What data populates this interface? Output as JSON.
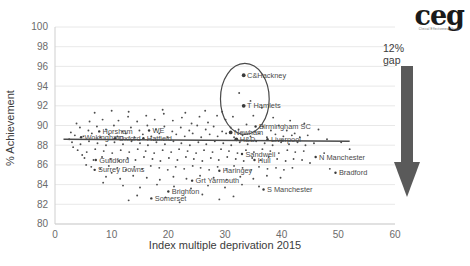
{
  "logo": {
    "word": "ceg",
    "subtitle": "Clinical Effectiveness Group"
  },
  "annotation": {
    "line1": "12%",
    "line2": "gap",
    "arrow": "down-arrow"
  },
  "chart_data": {
    "type": "scatter",
    "title": "",
    "xlabel": "Index multiple deprivation 2015",
    "ylabel": "% Achievement",
    "xlim": [
      0,
      60
    ],
    "ylim": [
      80,
      100
    ],
    "xticks": [
      0,
      10,
      20,
      30,
      40,
      50,
      60
    ],
    "yticks": [
      80,
      82,
      84,
      86,
      88,
      90,
      92,
      94,
      96,
      98,
      100
    ],
    "grid": "horizontal",
    "legend": "none",
    "trendline": {
      "type": "linear",
      "x": [
        1.5,
        52
      ],
      "y": [
        88.6,
        88.4
      ],
      "color": "#4a4a4a"
    },
    "highlight_ellipse": {
      "cx": 33.5,
      "cy": 92.7,
      "rx": 4.3,
      "ry": 3.6,
      "color": "#4a4a4a"
    },
    "labeled_points": [
      {
        "label": "C&Hackney",
        "x": 33.3,
        "y": 95.1
      },
      {
        "label": "T Hamlets",
        "x": 33.3,
        "y": 92.0
      },
      {
        "label": "Birmingham SC",
        "x": 35.4,
        "y": 89.9
      },
      {
        "label": "Newham",
        "x": 31.0,
        "y": 89.3
      },
      {
        "label": "H&D",
        "x": 32.0,
        "y": 88.6
      },
      {
        "label": "Liverpool",
        "x": 37.5,
        "y": 88.6
      },
      {
        "label": "Horsham",
        "x": 7.8,
        "y": 89.4
      },
      {
        "label": "Wokingham",
        "x": 4.6,
        "y": 88.8
      },
      {
        "label": "Oxford",
        "x": 10.6,
        "y": 88.7
      },
      {
        "label": "Hatfield",
        "x": 15.6,
        "y": 88.7
      },
      {
        "label": "WE",
        "x": 16.6,
        "y": 89.5
      },
      {
        "label": "Guildford",
        "x": 7.2,
        "y": 86.5
      },
      {
        "label": "Surrey Downs",
        "x": 7.0,
        "y": 85.5
      },
      {
        "label": "Somerset",
        "x": 17.0,
        "y": 82.6
      },
      {
        "label": "Brighton",
        "x": 20.0,
        "y": 83.3
      },
      {
        "label": "Grt Yarmouth",
        "x": 24.2,
        "y": 84.4
      },
      {
        "label": "Haringey",
        "x": 29.0,
        "y": 85.4
      },
      {
        "label": "Sandwell",
        "x": 33.0,
        "y": 87.1
      },
      {
        "label": "Hull",
        "x": 35.2,
        "y": 86.5
      },
      {
        "label": "S Manchester",
        "x": 36.8,
        "y": 83.5
      },
      {
        "label": "N Manchester",
        "x": 46.0,
        "y": 86.8
      },
      {
        "label": "Bradford",
        "x": 49.5,
        "y": 85.2
      }
    ],
    "cloud_points": [
      [
        6.1,
        90.4
      ],
      [
        8.4,
        90.6
      ],
      [
        11.2,
        90.5
      ],
      [
        12.9,
        90.9
      ],
      [
        14.5,
        90.4
      ],
      [
        16.1,
        91.0
      ],
      [
        17.6,
        90.6
      ],
      [
        19.2,
        91.2
      ],
      [
        20.8,
        90.5
      ],
      [
        22.4,
        90.8
      ],
      [
        24.1,
        90.2
      ],
      [
        25.5,
        90.9
      ],
      [
        27.0,
        90.3
      ],
      [
        28.6,
        91.0
      ],
      [
        30.1,
        90.6
      ],
      [
        31.4,
        90.9
      ],
      [
        4.4,
        89.8
      ],
      [
        5.9,
        89.5
      ],
      [
        7.4,
        89.9
      ],
      [
        9.0,
        89.6
      ],
      [
        10.4,
        90.0
      ],
      [
        11.9,
        89.4
      ],
      [
        13.4,
        89.8
      ],
      [
        14.9,
        89.5
      ],
      [
        16.3,
        90.0
      ],
      [
        17.8,
        89.6
      ],
      [
        19.3,
        89.9
      ],
      [
        20.7,
        89.4
      ],
      [
        22.2,
        89.8
      ],
      [
        23.7,
        89.5
      ],
      [
        25.1,
        90.0
      ],
      [
        26.6,
        89.6
      ],
      [
        28.0,
        89.9
      ],
      [
        29.5,
        89.4
      ],
      [
        31.0,
        89.8
      ],
      [
        32.4,
        89.6
      ],
      [
        33.8,
        90.1
      ],
      [
        35.2,
        89.4
      ],
      [
        36.7,
        89.9
      ],
      [
        38.1,
        89.5
      ],
      [
        39.5,
        90.0
      ],
      [
        40.9,
        89.5
      ],
      [
        42.3,
        89.2
      ],
      [
        3.5,
        89.0
      ],
      [
        5.0,
        88.9
      ],
      [
        6.5,
        89.2
      ],
      [
        8.0,
        88.8
      ],
      [
        9.5,
        89.1
      ],
      [
        11.0,
        88.9
      ],
      [
        12.5,
        89.2
      ],
      [
        14.0,
        88.8
      ],
      [
        15.5,
        89.1
      ],
      [
        17.0,
        88.9
      ],
      [
        18.4,
        89.2
      ],
      [
        19.9,
        88.8
      ],
      [
        21.4,
        89.1
      ],
      [
        22.9,
        88.9
      ],
      [
        24.3,
        89.2
      ],
      [
        25.8,
        88.8
      ],
      [
        27.3,
        89.1
      ],
      [
        28.7,
        88.9
      ],
      [
        30.2,
        89.2
      ],
      [
        31.6,
        88.8
      ],
      [
        33.1,
        89.0
      ],
      [
        34.5,
        88.9
      ],
      [
        36.0,
        89.2
      ],
      [
        37.4,
        88.8
      ],
      [
        38.9,
        89.1
      ],
      [
        40.3,
        88.9
      ],
      [
        41.8,
        89.0
      ],
      [
        43.2,
        88.8
      ],
      [
        44.6,
        89.0
      ],
      [
        3.0,
        88.3
      ],
      [
        4.5,
        88.1
      ],
      [
        6.0,
        88.4
      ],
      [
        7.5,
        88.2
      ],
      [
        9.0,
        88.0
      ],
      [
        10.5,
        88.3
      ],
      [
        12.0,
        88.1
      ],
      [
        13.5,
        88.4
      ],
      [
        15.0,
        88.2
      ],
      [
        16.4,
        88.0
      ],
      [
        17.9,
        88.3
      ],
      [
        19.4,
        88.1
      ],
      [
        20.9,
        88.4
      ],
      [
        22.3,
        88.2
      ],
      [
        23.8,
        88.0
      ],
      [
        25.3,
        88.3
      ],
      [
        26.7,
        88.1
      ],
      [
        28.2,
        88.4
      ],
      [
        29.7,
        88.2
      ],
      [
        31.1,
        88.0
      ],
      [
        32.6,
        88.3
      ],
      [
        34.0,
        88.1
      ],
      [
        35.5,
        88.4
      ],
      [
        37.0,
        88.2
      ],
      [
        38.4,
        88.0
      ],
      [
        39.9,
        88.3
      ],
      [
        41.3,
        88.1
      ],
      [
        42.8,
        88.3
      ],
      [
        44.2,
        88.0
      ],
      [
        45.7,
        88.2
      ],
      [
        4.0,
        87.5
      ],
      [
        5.6,
        87.3
      ],
      [
        7.1,
        87.6
      ],
      [
        8.6,
        87.4
      ],
      [
        10.1,
        87.2
      ],
      [
        11.6,
        87.5
      ],
      [
        13.1,
        87.3
      ],
      [
        14.6,
        87.6
      ],
      [
        16.0,
        87.4
      ],
      [
        17.5,
        87.2
      ],
      [
        19.0,
        87.5
      ],
      [
        20.5,
        87.3
      ],
      [
        21.9,
        87.6
      ],
      [
        23.4,
        87.4
      ],
      [
        24.9,
        87.2
      ],
      [
        26.3,
        87.5
      ],
      [
        27.8,
        87.3
      ],
      [
        29.3,
        87.6
      ],
      [
        30.7,
        87.4
      ],
      [
        32.2,
        87.2
      ],
      [
        33.7,
        87.5
      ],
      [
        35.1,
        87.3
      ],
      [
        36.6,
        87.6
      ],
      [
        38.0,
        87.4
      ],
      [
        39.5,
        87.2
      ],
      [
        41.0,
        87.5
      ],
      [
        42.4,
        87.3
      ],
      [
        43.9,
        87.4
      ],
      [
        5.2,
        86.7
      ],
      [
        6.8,
        86.5
      ],
      [
        8.3,
        86.8
      ],
      [
        9.8,
        86.6
      ],
      [
        11.3,
        86.4
      ],
      [
        12.8,
        86.7
      ],
      [
        14.2,
        86.5
      ],
      [
        15.7,
        86.8
      ],
      [
        17.2,
        86.6
      ],
      [
        18.6,
        86.4
      ],
      [
        20.1,
        86.7
      ],
      [
        21.6,
        86.5
      ],
      [
        23.1,
        86.8
      ],
      [
        24.5,
        86.6
      ],
      [
        26.0,
        86.4
      ],
      [
        27.5,
        86.7
      ],
      [
        28.9,
        86.5
      ],
      [
        30.4,
        86.8
      ],
      [
        31.9,
        86.6
      ],
      [
        33.3,
        86.4
      ],
      [
        34.8,
        86.7
      ],
      [
        36.3,
        86.5
      ],
      [
        37.7,
        86.8
      ],
      [
        39.2,
        86.6
      ],
      [
        40.7,
        86.4
      ],
      [
        42.1,
        86.6
      ],
      [
        43.6,
        86.5
      ],
      [
        6.4,
        85.8
      ],
      [
        8.0,
        85.6
      ],
      [
        9.5,
        85.9
      ],
      [
        11.0,
        85.7
      ],
      [
        12.5,
        85.5
      ],
      [
        14.0,
        85.8
      ],
      [
        15.4,
        85.6
      ],
      [
        16.9,
        85.9
      ],
      [
        18.4,
        85.7
      ],
      [
        19.9,
        85.5
      ],
      [
        21.3,
        85.8
      ],
      [
        22.8,
        85.6
      ],
      [
        24.3,
        85.9
      ],
      [
        25.7,
        85.7
      ],
      [
        27.2,
        85.5
      ],
      [
        28.7,
        85.8
      ],
      [
        30.2,
        85.6
      ],
      [
        31.6,
        85.9
      ],
      [
        33.1,
        85.7
      ],
      [
        34.6,
        85.5
      ],
      [
        36.0,
        85.8
      ],
      [
        37.5,
        85.6
      ],
      [
        39.0,
        85.7
      ],
      [
        40.4,
        85.5
      ],
      [
        41.9,
        85.7
      ],
      [
        9.0,
        84.8
      ],
      [
        11.5,
        84.6
      ],
      [
        13.8,
        84.9
      ],
      [
        16.2,
        84.7
      ],
      [
        18.5,
        84.5
      ],
      [
        20.9,
        84.8
      ],
      [
        23.2,
        84.6
      ],
      [
        25.6,
        84.9
      ],
      [
        28.0,
        84.7
      ],
      [
        30.3,
        84.5
      ],
      [
        32.7,
        84.8
      ],
      [
        35.0,
        84.6
      ],
      [
        37.4,
        84.9
      ],
      [
        39.8,
        84.7
      ],
      [
        12.0,
        83.9
      ],
      [
        15.0,
        83.7
      ],
      [
        18.0,
        84.0
      ],
      [
        21.0,
        83.8
      ],
      [
        24.0,
        83.6
      ],
      [
        27.0,
        83.9
      ],
      [
        30.0,
        83.7
      ],
      [
        33.0,
        84.0
      ],
      [
        36.0,
        83.8
      ],
      [
        14.5,
        82.9
      ],
      [
        19.5,
        82.7
      ],
      [
        26.0,
        83.0
      ],
      [
        31.5,
        82.8
      ],
      [
        13.0,
        82.4
      ],
      [
        22.0,
        82.2
      ],
      [
        29.0,
        82.5
      ],
      [
        7.0,
        91.3
      ],
      [
        10.0,
        91.5
      ],
      [
        13.0,
        91.4
      ],
      [
        19.0,
        91.6
      ],
      [
        23.0,
        91.3
      ],
      [
        26.5,
        91.5
      ],
      [
        29.5,
        91.4
      ],
      [
        35.0,
        91.0
      ],
      [
        38.5,
        90.8
      ],
      [
        41.5,
        90.5
      ],
      [
        44.0,
        90.2
      ],
      [
        46.5,
        89.6
      ],
      [
        48.0,
        88.6
      ],
      [
        50.5,
        88.3
      ],
      [
        52.0,
        87.6
      ],
      [
        47.5,
        87.2
      ],
      [
        45.0,
        86.2
      ],
      [
        48.5,
        85.6
      ],
      [
        3.8,
        90.2
      ],
      [
        2.8,
        89.3
      ],
      [
        2.5,
        88.6
      ],
      [
        3.2,
        87.8
      ],
      [
        4.8,
        87.0
      ],
      [
        5.5,
        86.0
      ],
      [
        10.0,
        85.2
      ],
      [
        8.5,
        84.2
      ],
      [
        34.5,
        92.5
      ],
      [
        36.5,
        91.8
      ],
      [
        32.5,
        93.3
      ]
    ]
  }
}
